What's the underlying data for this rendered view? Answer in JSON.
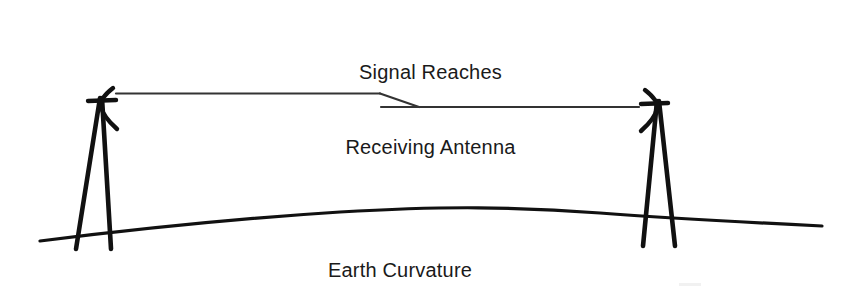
{
  "diagram": {
    "title_line_1": "Signal Reaches",
    "title_line_2": "Receiving Antenna",
    "earth_label": "Earth Curvature",
    "ink_color": "#111111",
    "background_color": "#ffffff",
    "elements": {
      "transmitting_tower": "antenna-tower-left",
      "receiving_tower": "antenna-tower-right",
      "signal_path": "signal-beam-line",
      "signal_kink": "signal-zigzag",
      "ground": "earth-curvature-arc"
    }
  }
}
